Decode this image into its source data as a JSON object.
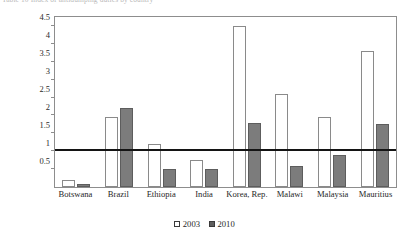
{
  "caption": {
    "text": "Table 10 Index of antidumping duties by country"
  },
  "chart_data": {
    "type": "bar",
    "title": "",
    "subtitle": "",
    "xlabel": "",
    "ylabel": "",
    "categories": [
      "Botswana",
      "Brazil",
      "Ethiopia",
      "India",
      "Korea, Rep.",
      "Malawi",
      "Malaysia",
      "Mauritius"
    ],
    "series": [
      {
        "name": "2003",
        "values": [
          0.2,
          1.95,
          1.2,
          0.75,
          4.5,
          2.6,
          1.95,
          3.8
        ]
      },
      {
        "name": "2010",
        "values": [
          0.08,
          2.2,
          0.5,
          0.5,
          1.8,
          0.6,
          0.9,
          1.75
        ]
      }
    ],
    "ylim": [
      0,
      4.75
    ],
    "yticks": [
      0.5,
      1,
      1.5,
      2,
      2.5,
      3,
      3.5,
      4,
      4.5
    ],
    "ytick_labels": [
      "0.5",
      "1",
      "1.5",
      "2",
      "2.5",
      "3",
      "3.5",
      "4",
      "4.5"
    ],
    "reference_line": 1,
    "grid": false,
    "legend_position": "bottom",
    "colors": {
      "series_2003": "#ffffff",
      "series_2003_border": "#8a8a8a",
      "series_2010": "#7c7c7c",
      "series_2010_border": "#5d5d5d",
      "reference_line": "#141414",
      "frame": "#8d8d8d"
    }
  },
  "legend": {
    "entries": [
      {
        "label": "2003",
        "swatch": "open-square-icon"
      },
      {
        "label": "2010",
        "swatch": "filled-square-icon"
      }
    ]
  }
}
